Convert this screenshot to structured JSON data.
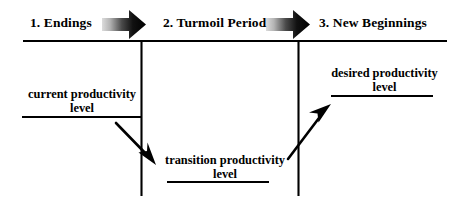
{
  "diagram": {
    "colors": {
      "ink": "#000000",
      "background": "#ffffff",
      "arrow_gradient_start": "#d9d9d9",
      "arrow_gradient_end": "#000000"
    },
    "phases": [
      {
        "id": "endings",
        "label": "1. Endings"
      },
      {
        "id": "turmoil",
        "label": "2. Turmoil Period"
      },
      {
        "id": "new-beginnings",
        "label": "3. New Beginnings"
      }
    ],
    "phase_arrows": [
      {
        "id": "arrow-endings-to-turmoil",
        "icon": "right-arrow-icon"
      },
      {
        "id": "arrow-turmoil-to-new-beginnings",
        "icon": "right-arrow-icon"
      }
    ],
    "timeline": {
      "icon": "horizontal-rule-icon",
      "dividers": [
        {
          "id": "divider-1",
          "icon": "vertical-divider-icon"
        },
        {
          "id": "divider-2",
          "icon": "vertical-divider-icon"
        }
      ]
    },
    "annotations": [
      {
        "id": "current-productivity-level",
        "line1": "current productivity",
        "line2": "level"
      },
      {
        "id": "transition-productivity-level",
        "line1": "transition  productivity",
        "line2": "level"
      },
      {
        "id": "desired-productivity-level",
        "line1": "desired  productivity",
        "line2": "level"
      }
    ],
    "trend_arrows": [
      {
        "id": "arrow-decline",
        "icon": "down-right-arrow-icon",
        "direction": "down-right"
      },
      {
        "id": "arrow-recovery",
        "icon": "up-right-arrow-icon",
        "direction": "up-right"
      }
    ]
  }
}
